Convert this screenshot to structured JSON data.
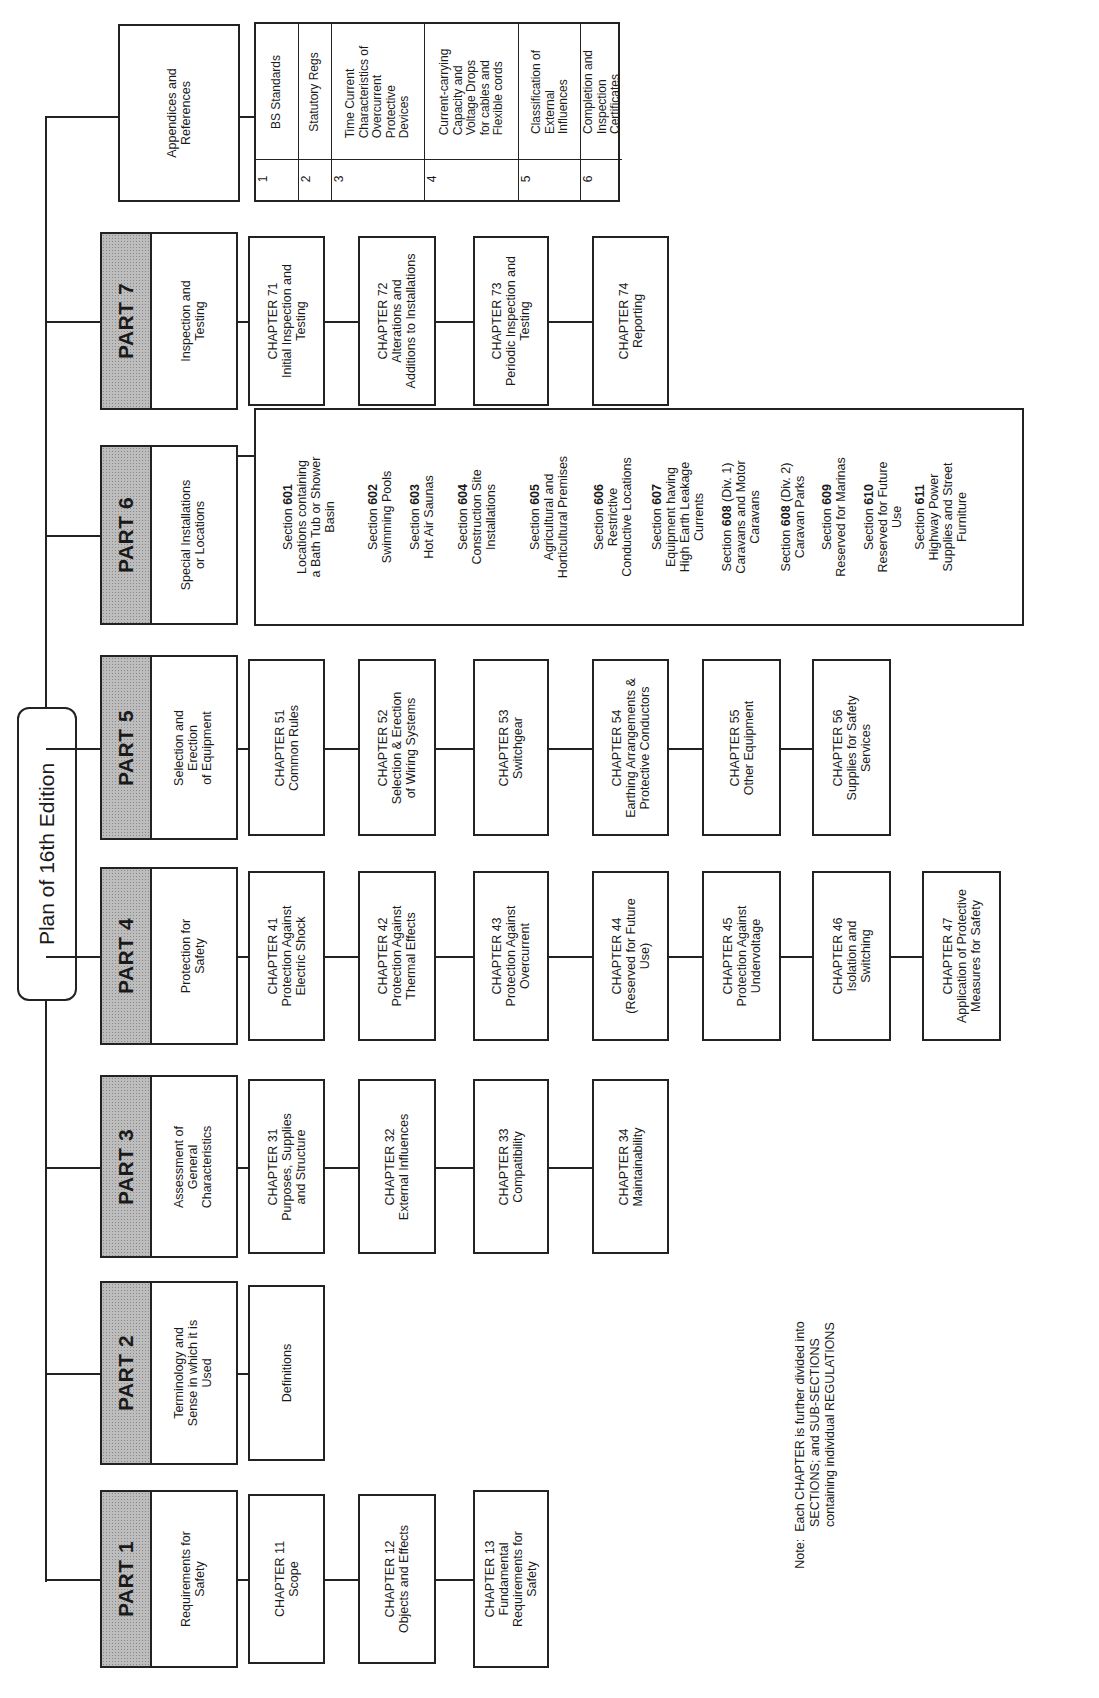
{
  "title": "Plan of 16th Edition",
  "parts": [
    {
      "label": "PART 1",
      "desc": "Requirements for\nSafety",
      "chapters": [
        "CHAPTER 11\nScope",
        "CHAPTER 12\nObjects and Effects",
        "CHAPTER 13\nFundamental\nRequirements for\nSafety"
      ]
    },
    {
      "label": "PART 2",
      "desc": "Terminology and\nSense in which it is\nUsed",
      "chapters": [
        "Definitions"
      ]
    },
    {
      "label": "PART 3",
      "desc": "Assessment of\nGeneral\nCharacteristics",
      "chapters": [
        "CHAPTER 31\nPurposes, Supplies\nand Structure",
        "CHAPTER 32\nExternal Influences",
        "CHAPTER 33\nCompatibility",
        "CHAPTER 34\nMaintainability"
      ]
    },
    {
      "label": "PART 4",
      "desc": "Protection for\nSafety",
      "chapters": [
        "CHAPTER 41\nProtection Against\nElectric Shock",
        "CHAPTER 42\nProtection Against\nThermal Effects",
        "CHAPTER 43\nProtection Against\nOvercurrent",
        "CHAPTER 44\n(Reserved for Future\nUse)",
        "CHAPTER 45\nProtection Against\nUndervoltage",
        "CHAPTER 46\nIsolation and\nSwitching",
        "CHAPTER 47\nApplication of Protective\nMeasures for Safety"
      ]
    },
    {
      "label": "PART 5",
      "desc": "Selection and\nErection\nof Equipment",
      "chapters": [
        "CHAPTER 51\nCommon Rules",
        "CHAPTER 52\nSelection & Erection\nof Wiring Systems",
        "CHAPTER 53\nSwitchgear",
        "CHAPTER 54\nEarthing Arrangements &\nProtective Conductors",
        "CHAPTER 55\nOther Equipment",
        "CHAPTER 56\nSupplies for Safety\nServices"
      ]
    },
    {
      "label": "PART 6",
      "desc": "Special Installations\nor Locations",
      "sections": [
        {
          "prefix": "Section ",
          "num": "601",
          "suffix": "",
          "text": "Locations containing\na Bath Tub or Shower\nBasin"
        },
        {
          "prefix": "Section ",
          "num": "602",
          "suffix": "",
          "text": "Swimming Pools"
        },
        {
          "prefix": "Section ",
          "num": "603",
          "suffix": "",
          "text": "Hot Air Saunas"
        },
        {
          "prefix": "Section ",
          "num": "604",
          "suffix": "",
          "text": "Construction Site\nInstallations"
        },
        {
          "prefix": "Section ",
          "num": "605",
          "suffix": "",
          "text": "Agricultural and\nHorticultural Premises"
        },
        {
          "prefix": "Section ",
          "num": "606",
          "suffix": "",
          "text": "Restrictive\nConductive Locations"
        },
        {
          "prefix": "Section ",
          "num": "607",
          "suffix": "",
          "text": "Equipment having\nHigh Earth Leakage\nCurrents"
        },
        {
          "prefix": "Section ",
          "num": "608",
          "suffix": " (Div. 1)",
          "text": "Caravans and Motor\nCaravans"
        },
        {
          "prefix": "Section ",
          "num": "608",
          "suffix": " (Div. 2)",
          "text": "Caravan Parks"
        },
        {
          "prefix": "Section ",
          "num": "609",
          "suffix": "",
          "text": "Reserved for Marinas"
        },
        {
          "prefix": "Section ",
          "num": "610",
          "suffix": "",
          "text": "Reserved for Future\nUse"
        },
        {
          "prefix": "Section ",
          "num": "611",
          "suffix": "",
          "text": "Highway Power\nSupplies and Street\nFurniture"
        }
      ]
    },
    {
      "label": "PART 7",
      "desc": "Inspection and\nTesting",
      "chapters": [
        "CHAPTER 71\nInitial Inspection and\nTesting",
        "CHAPTER 72\nAlterations and\nAdditions to Installations",
        "CHAPTER 73\nPeriodic Inspection and\nTesting",
        "CHAPTER 74\nReporting"
      ]
    }
  ],
  "appendices": {
    "label": "Appendices and\nReferences",
    "items": [
      {
        "num": "1",
        "text": "BS Standards"
      },
      {
        "num": "2",
        "text": "Statutory Regs"
      },
      {
        "num": "3",
        "text": "Time Current\nCharacteristics of\nOvercurrent\nProtective\nDevices"
      },
      {
        "num": "4",
        "text": "Current-carrying\nCapacity and\nVoltage Drops\nfor cables and\nFlexible cords"
      },
      {
        "num": "5",
        "text": "Classification of\nExternal\nInfluences"
      },
      {
        "num": "6",
        "text": "Completion and\nInspection\nCertificates"
      }
    ]
  },
  "note": "Note:  Each CHAPTER is further divided into\n            SECTIONS; and SUB-SECTIONS\n            containing individual REGULATIONS"
}
